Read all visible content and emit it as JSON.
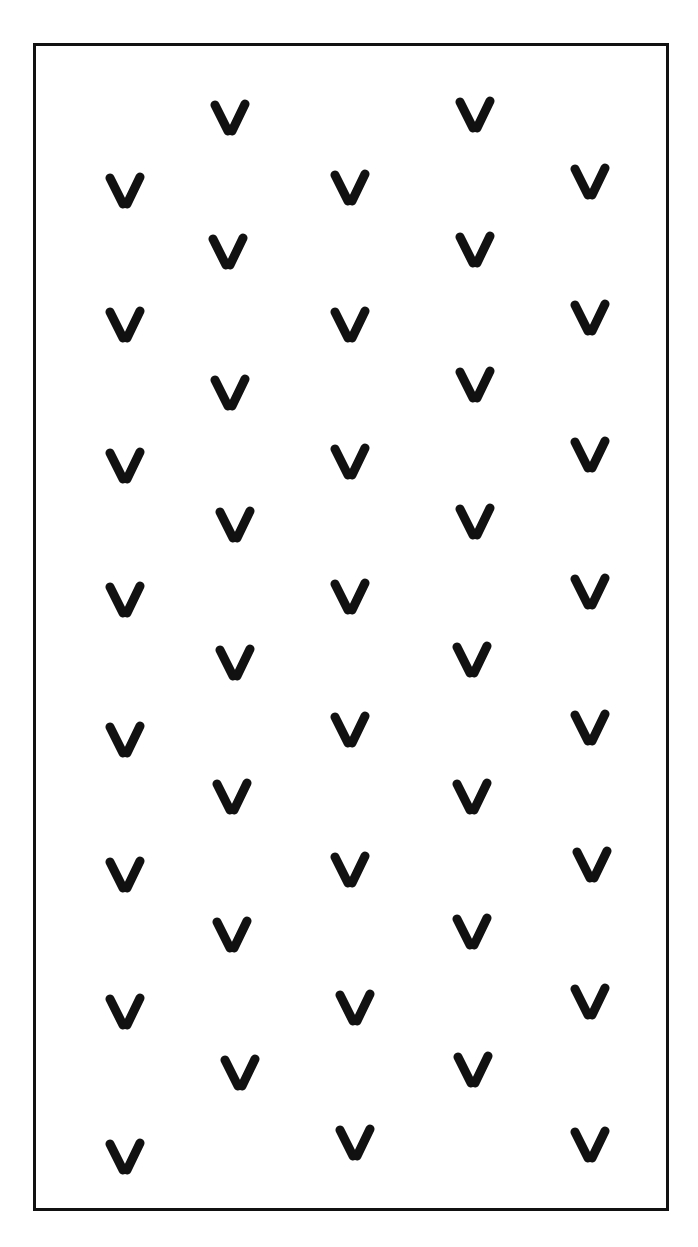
{
  "figure": {
    "mark_symbol": "V",
    "mark_color": "#111111",
    "border_color": "#111111"
  },
  "marks": [
    {
      "x": 230,
      "y": 118
    },
    {
      "x": 475,
      "y": 115
    },
    {
      "x": 125,
      "y": 191
    },
    {
      "x": 350,
      "y": 188
    },
    {
      "x": 590,
      "y": 182
    },
    {
      "x": 228,
      "y": 252
    },
    {
      "x": 475,
      "y": 250
    },
    {
      "x": 125,
      "y": 325
    },
    {
      "x": 350,
      "y": 325
    },
    {
      "x": 590,
      "y": 318
    },
    {
      "x": 230,
      "y": 393
    },
    {
      "x": 475,
      "y": 385
    },
    {
      "x": 125,
      "y": 466
    },
    {
      "x": 350,
      "y": 462
    },
    {
      "x": 590,
      "y": 455
    },
    {
      "x": 235,
      "y": 525
    },
    {
      "x": 475,
      "y": 522
    },
    {
      "x": 125,
      "y": 600
    },
    {
      "x": 350,
      "y": 597
    },
    {
      "x": 590,
      "y": 592
    },
    {
      "x": 235,
      "y": 663
    },
    {
      "x": 472,
      "y": 660
    },
    {
      "x": 125,
      "y": 740
    },
    {
      "x": 350,
      "y": 730
    },
    {
      "x": 590,
      "y": 728
    },
    {
      "x": 232,
      "y": 797
    },
    {
      "x": 472,
      "y": 797
    },
    {
      "x": 125,
      "y": 875
    },
    {
      "x": 350,
      "y": 870
    },
    {
      "x": 592,
      "y": 865
    },
    {
      "x": 232,
      "y": 935
    },
    {
      "x": 472,
      "y": 932
    },
    {
      "x": 125,
      "y": 1012
    },
    {
      "x": 355,
      "y": 1008
    },
    {
      "x": 590,
      "y": 1002
    },
    {
      "x": 240,
      "y": 1073
    },
    {
      "x": 473,
      "y": 1070
    },
    {
      "x": 125,
      "y": 1157
    },
    {
      "x": 355,
      "y": 1143
    },
    {
      "x": 590,
      "y": 1145
    }
  ]
}
